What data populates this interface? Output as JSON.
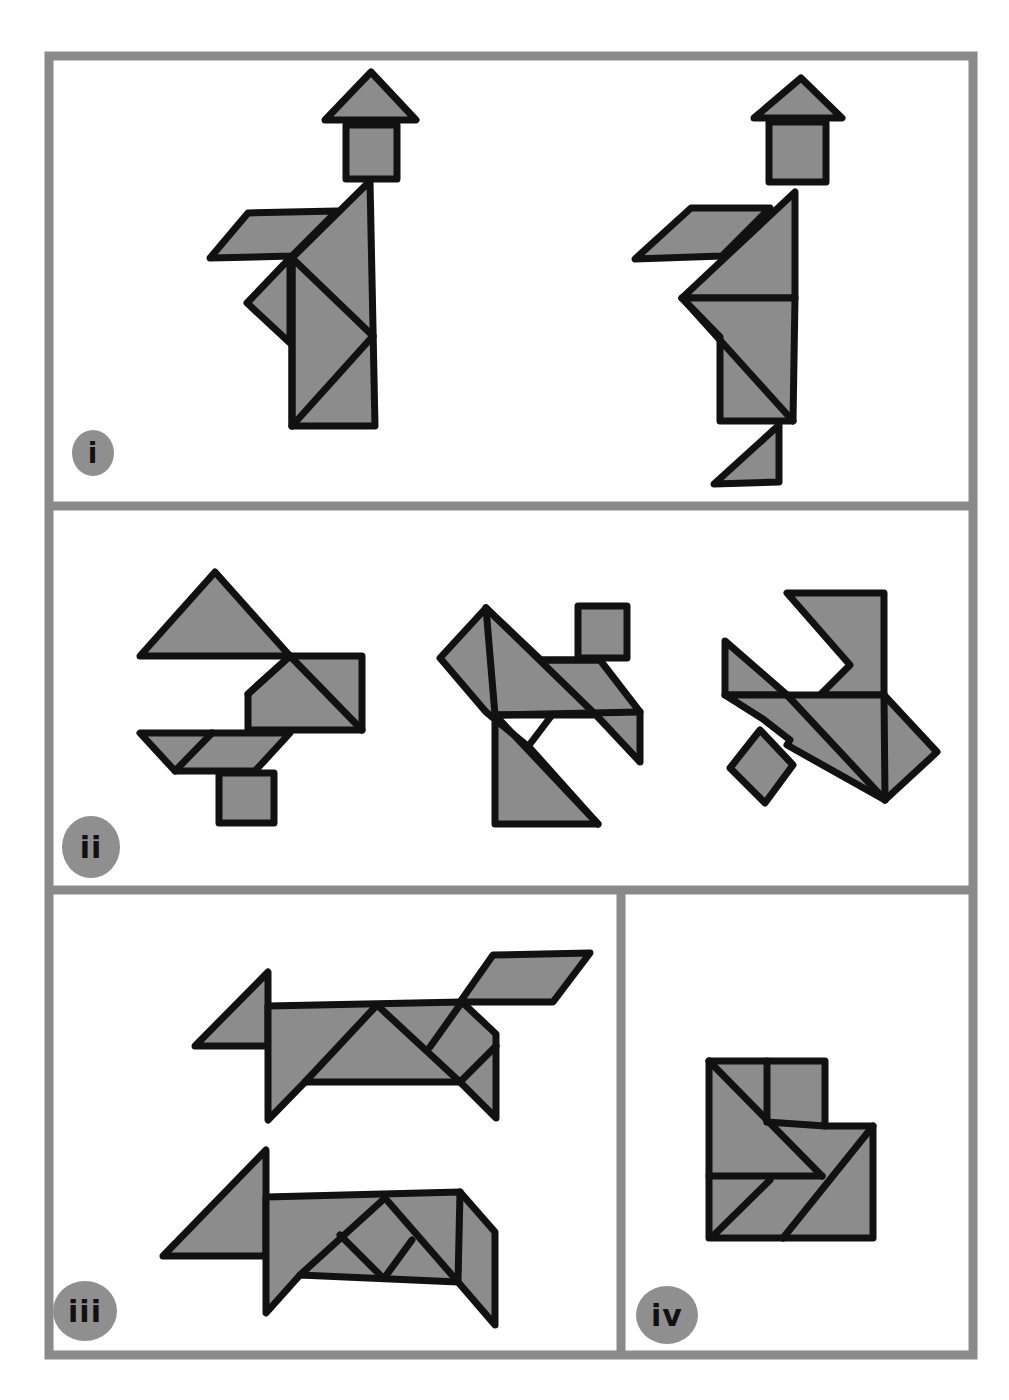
{
  "panels": [
    {
      "id": "i",
      "label": "i",
      "description": "Two standing human figures wearing hats, built from tangram pieces"
    },
    {
      "id": "ii",
      "label": "ii",
      "description": "Three abstract figures (bird/animal shapes) built from tangram pieces"
    },
    {
      "id": "iii",
      "label": "iii",
      "description": "Two four-legged animal figures (dog/horse) built from tangram pieces"
    },
    {
      "id": "iv",
      "label": "iv",
      "description": "A compact chair/boot-like figure built from tangram pieces"
    }
  ],
  "colors": {
    "piece_fill": "#8c8c8c",
    "outline": "#111111",
    "frame": "#8a8a8a",
    "background": "#ffffff",
    "badge": "#8f8f8f"
  }
}
